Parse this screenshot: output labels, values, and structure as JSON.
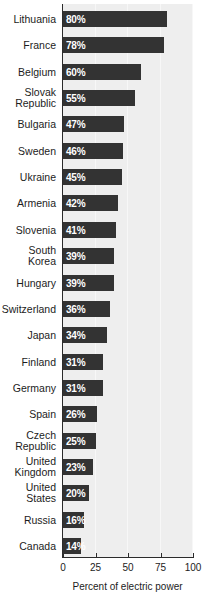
{
  "chart_data": {
    "type": "bar",
    "orientation": "horizontal",
    "title": "",
    "xlabel": "Percent of electric power",
    "ylabel": "",
    "xlim": [
      0,
      100
    ],
    "xticks": [
      "0",
      "25",
      "50",
      "75",
      "100"
    ],
    "grid": true,
    "legend": null,
    "categories": [
      "Lithuania",
      "France",
      "Belgium",
      "Slovak\nRepublic",
      "Bulgaria",
      "Sweden",
      "Ukraine",
      "Armenia",
      "Slovenia",
      "South\nKorea",
      "Hungary",
      "Switzerland",
      "Japan",
      "Finland",
      "Germany",
      "Spain",
      "Czech\nRepublic",
      "United\nKingdom",
      "United\nStates",
      "Russia",
      "Canada"
    ],
    "values": [
      80,
      78,
      60,
      55,
      47,
      46,
      45,
      42,
      41,
      39,
      39,
      36,
      34,
      31,
      31,
      26,
      25,
      23,
      20,
      16,
      14
    ],
    "data_labels": [
      "80%",
      "78%",
      "60%",
      "55%",
      "47%",
      "46%",
      "45%",
      "42%",
      "41%",
      "39%",
      "39%",
      "36%",
      "34%",
      "31%",
      "31%",
      "26%",
      "25%",
      "23%",
      "20%",
      "16%",
      "14%"
    ]
  },
  "colors": {
    "bar": "#333333",
    "plot_background": "#eeeeee",
    "page_background": "#ffffff",
    "axis": "#2b2b2b",
    "text": "#1c1c1c",
    "value_label": "#ffffff"
  }
}
